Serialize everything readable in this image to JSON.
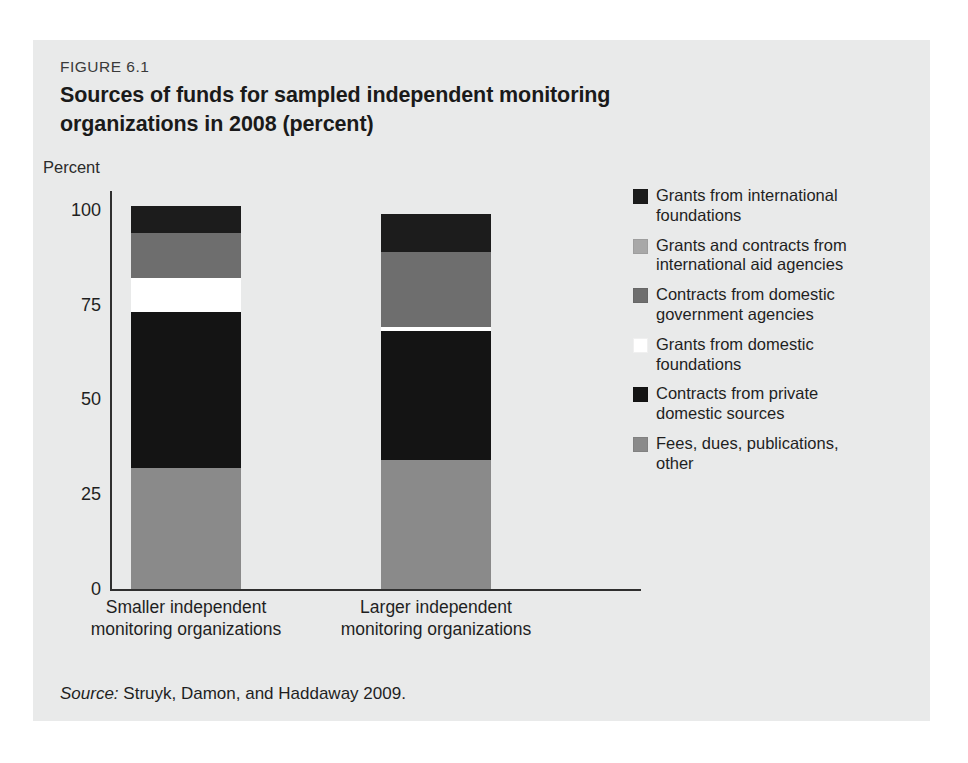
{
  "figure": {
    "number": "FIGURE 6.1",
    "title": "Sources of funds for sampled independent monitoring organizations in 2008 (percent)",
    "source_word": "Source:",
    "source_text": " Struyk, Damon, and Haddaway 2009.",
    "panel_bg": "#e9eaea"
  },
  "chart_data": {
    "type": "bar",
    "stacked": true,
    "title": "Sources of funds for sampled independent monitoring organizations in 2008 (percent)",
    "xlabel": "",
    "ylabel": "Percent",
    "ylim": [
      0,
      105
    ],
    "yticks": [
      0,
      25,
      50,
      75,
      100
    ],
    "ytick_labels": [
      "0",
      "25",
      "50",
      "75",
      "100"
    ],
    "grid": false,
    "legend_position": "right",
    "categories": [
      "Smaller independent monitoring organizations",
      "Larger independent monitoring organizations"
    ],
    "category_lines": [
      [
        "Smaller independent",
        "monitoring organizations"
      ],
      [
        "Larger independent",
        "monitoring organizations"
      ]
    ],
    "series": [
      {
        "name": "Fees, dues, publications, other",
        "color": "#8a8a8a",
        "values": [
          32,
          34
        ]
      },
      {
        "name": "Contracts from private domestic sources",
        "color": "#141414",
        "values": [
          41,
          34
        ]
      },
      {
        "name": "Grants from domestic foundations",
        "color": "#ffffff",
        "values": [
          9,
          1
        ]
      },
      {
        "name": "Contracts from domestic government agencies",
        "color": "#6e6e6e",
        "values": [
          12,
          20
        ]
      },
      {
        "name": "Grants and contracts from international aid agencies",
        "color": "#a8a8a8",
        "values": [
          0,
          0
        ]
      },
      {
        "name": "Grants from international foundations",
        "color": "#1c1c1c",
        "values": [
          7,
          10
        ]
      }
    ],
    "totals": [
      101,
      99
    ]
  },
  "legend": {
    "items": [
      {
        "color": "#1c1c1c",
        "lines": [
          "Grants from international",
          "foundations"
        ]
      },
      {
        "color": "#a8a8a8",
        "lines": [
          "Grants and contracts from",
          "international aid agencies"
        ]
      },
      {
        "color": "#6e6e6e",
        "lines": [
          "Contracts from domestic",
          "government agencies"
        ]
      },
      {
        "color": "#ffffff",
        "lines": [
          "Grants from domestic",
          "foundations"
        ]
      },
      {
        "color": "#141414",
        "lines": [
          "Contracts from private",
          "domestic sources"
        ]
      },
      {
        "color": "#8a8a8a",
        "lines": [
          "Fees, dues, publications,",
          "other"
        ]
      }
    ]
  }
}
